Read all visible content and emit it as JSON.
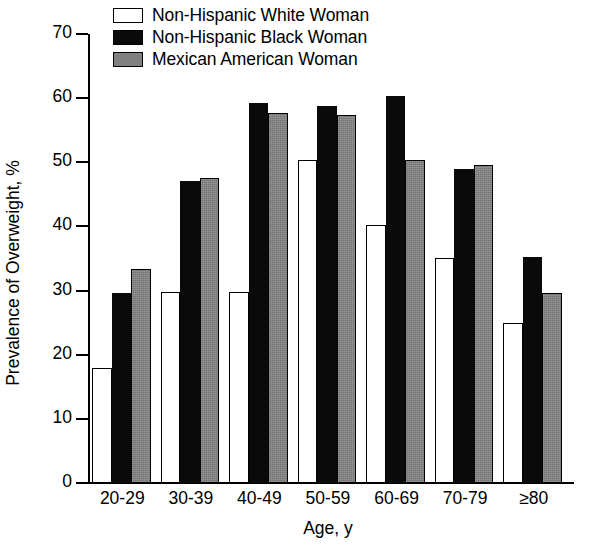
{
  "chart_data": {
    "type": "bar",
    "title": "",
    "xlabel": "Age, y",
    "ylabel": "Prevalence of Overweight, %",
    "categories": [
      "20-29",
      "30-39",
      "40-49",
      "50-59",
      "60-69",
      "70-79",
      "≥80"
    ],
    "series": [
      {
        "name": "Non-Hispanic White Woman",
        "color": "#ffffff",
        "values": [
          18.0,
          29.8,
          29.7,
          50.3,
          40.3,
          35.1,
          25.0
        ]
      },
      {
        "name": "Non-Hispanic Black Woman",
        "color": "#0a0a0a",
        "values": [
          29.6,
          47.1,
          59.3,
          58.7,
          60.3,
          48.9,
          35.2
        ]
      },
      {
        "name": "Mexican American Woman",
        "color": "#808080",
        "values": [
          33.3,
          47.6,
          57.7,
          57.4,
          50.4,
          49.5,
          29.6
        ]
      }
    ],
    "ylim": [
      0,
      70
    ],
    "yticks": [
      0,
      10,
      20,
      30,
      40,
      50,
      60,
      70
    ],
    "ytick_labels": [
      "0",
      "10",
      "20",
      "30",
      "40",
      "50",
      "60",
      "70"
    ],
    "grid": false,
    "legend_position": "top-left-inside"
  },
  "legend": {
    "items": [
      {
        "label": "Non-Hispanic White Woman",
        "swatch": "white-swatch"
      },
      {
        "label": "Non-Hispanic Black Woman",
        "swatch": "black-swatch"
      },
      {
        "label": "Mexican American Woman",
        "swatch": "gray-swatch"
      }
    ]
  },
  "axes": {
    "y_title": "Prevalence of Overweight, %",
    "x_title": "Age, y"
  }
}
